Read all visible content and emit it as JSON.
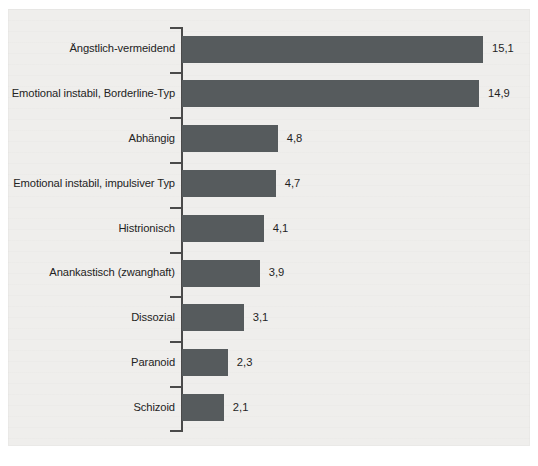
{
  "chart_data": {
    "type": "bar",
    "orientation": "horizontal",
    "title": "",
    "subtitle": "",
    "xlabel": "",
    "ylabel": "",
    "categories": [
      "Ängstlich-vermeidend",
      "Emotional instabil, Borderline-Typ",
      "Abhängig",
      "Emotional instabil, impulsiver Typ",
      "Histrionisch",
      "Anankastisch (zwanghaft)",
      "Dissozial",
      "Paranoid",
      "Schizoid"
    ],
    "values": [
      15.1,
      14.9,
      4.8,
      4.7,
      4.1,
      3.9,
      3.1,
      2.3,
      2.1
    ],
    "value_labels": [
      "15,1",
      "14,9",
      "4,8",
      "4,7",
      "4,1",
      "3,9",
      "3,1",
      "2,3",
      "2,1"
    ],
    "xlim": [
      0,
      15.1
    ],
    "grid": false,
    "legend": null,
    "bar_color": "#565b5d",
    "axis_color": "#4a4a4a",
    "label_color": "#232323",
    "background_color": "#efeeec",
    "page_color": "#ffffff",
    "decimal_separator": ","
  },
  "figure": {
    "axis_name": "category-axis",
    "ticks_between_bars": true
  }
}
